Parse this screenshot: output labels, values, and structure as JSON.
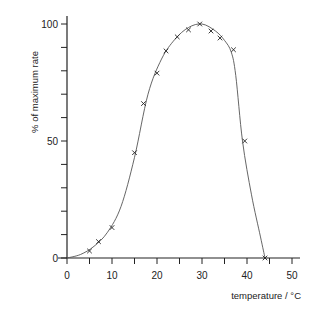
{
  "chart_data": {
    "type": "scatter",
    "title": "",
    "xlabel": "temperature / °C",
    "ylabel": "% of maximum rate",
    "xlim": [
      0,
      50
    ],
    "ylim": [
      0,
      100
    ],
    "x_ticks": [
      0,
      5,
      10,
      15,
      20,
      25,
      30,
      35,
      40,
      45,
      50
    ],
    "x_tick_labels": [
      "0",
      "10",
      "20",
      "30",
      "40",
      "50"
    ],
    "y_ticks": [
      0,
      10,
      20,
      30,
      40,
      50,
      60,
      70,
      80,
      90,
      100
    ],
    "y_tick_labels": [
      "0",
      "50",
      "100"
    ],
    "grid": false,
    "legend": null,
    "series": [
      {
        "name": "measured rate",
        "marker": "x",
        "x": [
          5,
          7,
          10,
          15,
          17,
          20,
          22,
          24.5,
          27,
          29.5,
          32,
          34,
          37,
          39.5,
          44
        ],
        "y": [
          3,
          7,
          13,
          45,
          66,
          79,
          88.5,
          94.5,
          97.5,
          100,
          97,
          94,
          89,
          50,
          0
        ]
      },
      {
        "name": "fitted curve",
        "type": "line",
        "x": [
          0,
          3,
          6,
          9,
          12,
          15,
          18,
          21,
          24,
          27,
          30,
          33,
          35,
          36.5,
          37.5,
          39,
          41,
          43,
          44
        ],
        "y": [
          0,
          1.5,
          5,
          11,
          22,
          43,
          70,
          85,
          93.5,
          98.5,
          100,
          97,
          93,
          88,
          78,
          50,
          27,
          9,
          0
        ]
      }
    ]
  }
}
